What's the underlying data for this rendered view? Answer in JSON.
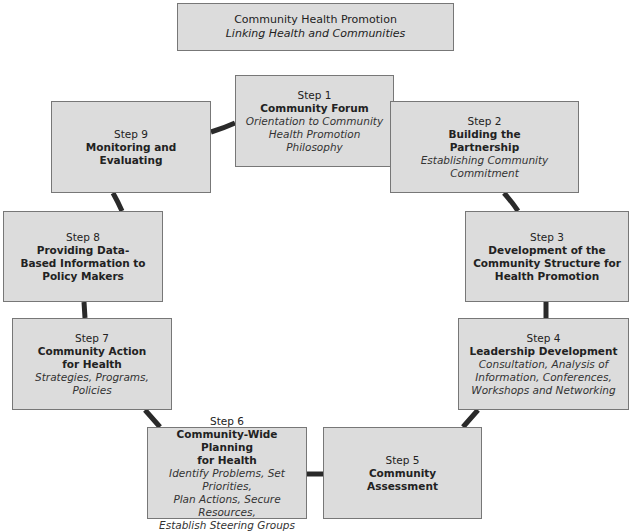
{
  "title": {
    "heading": "Community Health Promotion",
    "subtitle": "Linking Health and Communities"
  },
  "steps": [
    {
      "step": "Step 1",
      "name_lines": [
        "Community Forum"
      ],
      "desc_lines": [
        "Orientation to Community",
        "Health Promotion",
        "Philosophy"
      ]
    },
    {
      "step": "Step 2",
      "name_lines": [
        "Building the",
        "Partnership"
      ],
      "desc_lines": [
        "Establishing Community",
        "Commitment"
      ]
    },
    {
      "step": "Step 3",
      "name_lines": [
        "Development of the",
        "Community Structure for",
        "Health Promotion"
      ],
      "desc_lines": []
    },
    {
      "step": "Step 4",
      "name_lines": [
        "Leadership Development"
      ],
      "desc_lines": [
        "Consultation, Analysis of",
        "Information, Conferences,",
        "Workshops and Networking"
      ]
    },
    {
      "step": "Step 5",
      "name_lines": [
        "Community",
        "Assessment"
      ],
      "desc_lines": []
    },
    {
      "step": "Step 6",
      "name_lines": [
        "Community-Wide Planning",
        "for Health"
      ],
      "desc_lines": [
        "Identify Problems, Set Priorities,",
        "Plan Actions, Secure Resources,",
        "Establish Steering Groups"
      ]
    },
    {
      "step": "Step 7",
      "name_lines": [
        "Community Action",
        "for Health"
      ],
      "desc_lines": [
        "Strategies, Programs,",
        "Policies"
      ]
    },
    {
      "step": "Step 8",
      "name_lines": [
        "Providing Data-",
        "Based Information to",
        "Policy Makers"
      ],
      "desc_lines": []
    },
    {
      "step": "Step 9",
      "name_lines": [
        "Monitoring and",
        "Evaluating"
      ],
      "desc_lines": []
    }
  ],
  "colors": {
    "box_fill": "#dcdcdc",
    "box_border": "#777777",
    "connector": "#2a2a2a"
  }
}
